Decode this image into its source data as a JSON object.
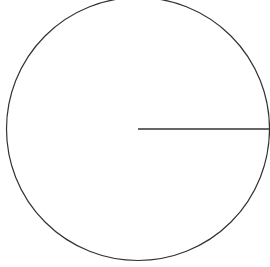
{
  "diagram": {
    "type": "circle-with-radius",
    "canvas": {
      "width": 270,
      "height": 267
    },
    "circle": {
      "cx": 138,
      "cy": 129,
      "r": 131.5,
      "stroke": "#333333",
      "stroke_width": 1.2,
      "fill": "none"
    },
    "radius_line": {
      "x1": 138,
      "y1": 129,
      "x2": 269.5,
      "y2": 129,
      "stroke": "#333333",
      "stroke_width": 1.4
    }
  }
}
